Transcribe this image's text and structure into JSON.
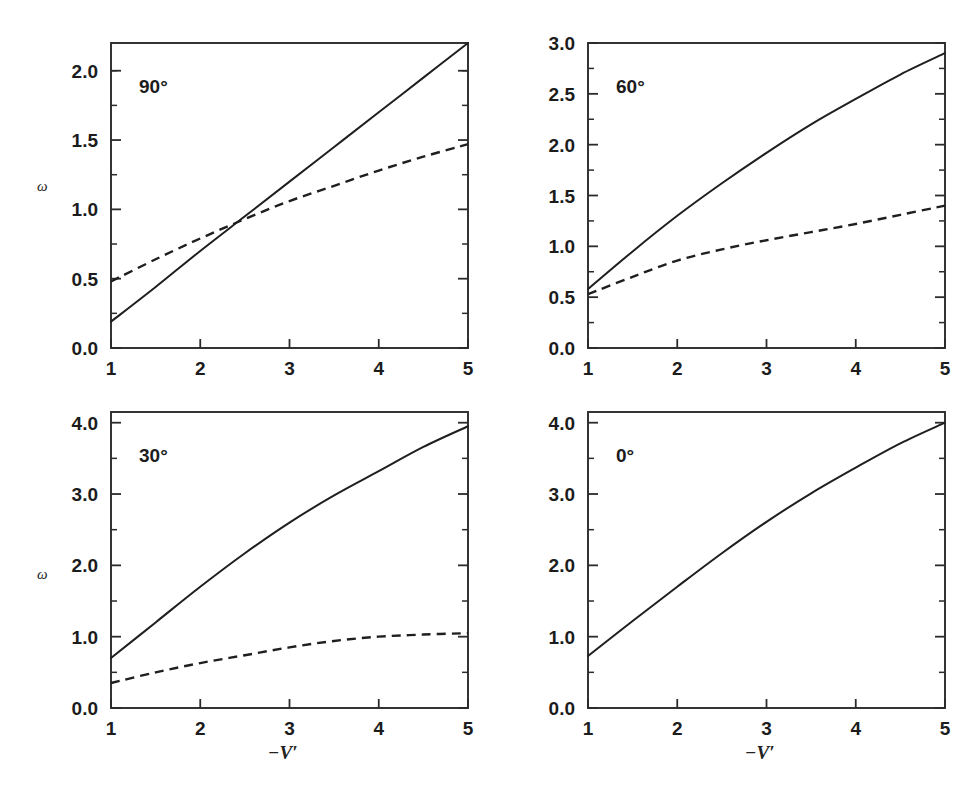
{
  "figure": {
    "background": "#ffffff",
    "ink_color": "#1f1f1f",
    "layout": "2x2 grid of line plots",
    "x_axis_label": "−V′",
    "y_axis_label": "ω"
  },
  "chart_data": [
    {
      "type": "line",
      "panel_id": "panel-90",
      "annotation": "90°",
      "title": "",
      "xlabel": "",
      "ylabel": "ω",
      "xlim": [
        1,
        5
      ],
      "ylim": [
        0.0,
        2.2
      ],
      "xticks": [
        1,
        2,
        3,
        4,
        5
      ],
      "xticklabels": [
        "1",
        "2",
        "3",
        "4",
        "5"
      ],
      "yticks": [
        0.0,
        0.5,
        1.0,
        1.5,
        2.0
      ],
      "yticklabels": [
        "0.0",
        "0.5",
        "1.0",
        "1.5",
        "2.0"
      ],
      "yminorticks": [
        0.25,
        0.75,
        1.25,
        1.75,
        2.0
      ],
      "grid": false,
      "legend": "none",
      "x": [
        1.0,
        1.5,
        2.0,
        2.5,
        3.0,
        3.5,
        4.0,
        4.5,
        5.0
      ],
      "series": [
        {
          "name": "solid",
          "style": "solid",
          "values": [
            0.19,
            0.44,
            0.7,
            0.95,
            1.2,
            1.45,
            1.7,
            1.95,
            2.2
          ]
        },
        {
          "name": "dashed",
          "style": "dashed",
          "values": [
            0.48,
            0.64,
            0.79,
            0.93,
            1.06,
            1.17,
            1.28,
            1.38,
            1.47
          ]
        }
      ],
      "notes": "solid and dashed curves cross near -V' = 2.65, omega = 1.02"
    },
    {
      "type": "line",
      "panel_id": "panel-60",
      "annotation": "60°",
      "title": "",
      "xlabel": "",
      "ylabel": "",
      "xlim": [
        1,
        5
      ],
      "ylim": [
        0.0,
        3.0
      ],
      "xticks": [
        1,
        2,
        3,
        4,
        5
      ],
      "xticklabels": [
        "1",
        "2",
        "3",
        "4",
        "5"
      ],
      "yticks": [
        0.0,
        0.5,
        1.0,
        1.5,
        2.0,
        2.5,
        3.0
      ],
      "yticklabels": [
        "0.0",
        "0.5",
        "1.0",
        "1.5",
        "2.0",
        "2.5",
        "3.0"
      ],
      "yminorticks": [
        0.25,
        0.75,
        1.25,
        1.75,
        2.25,
        2.75
      ],
      "grid": false,
      "legend": "none",
      "x": [
        1.0,
        1.5,
        2.0,
        2.5,
        3.0,
        3.5,
        4.0,
        4.5,
        5.0
      ],
      "series": [
        {
          "name": "solid",
          "style": "solid",
          "values": [
            0.58,
            0.95,
            1.3,
            1.62,
            1.92,
            2.2,
            2.45,
            2.69,
            2.9
          ]
        },
        {
          "name": "dashed",
          "style": "dashed",
          "values": [
            0.53,
            0.7,
            0.86,
            0.97,
            1.06,
            1.14,
            1.22,
            1.31,
            1.4
          ]
        }
      ],
      "notes": "both curves start together near omega = 0.55 at -V' = 1"
    },
    {
      "type": "line",
      "panel_id": "panel-30",
      "annotation": "30°",
      "title": "",
      "xlabel": "−V′",
      "ylabel": "ω",
      "xlim": [
        1,
        5
      ],
      "ylim": [
        0.0,
        4.15
      ],
      "xticks": [
        1,
        2,
        3,
        4,
        5
      ],
      "xticklabels": [
        "1",
        "2",
        "3",
        "4",
        "5"
      ],
      "yticks": [
        0.0,
        1.0,
        2.0,
        3.0,
        4.0
      ],
      "yticklabels": [
        "0.0",
        "1.0",
        "2.0",
        "3.0",
        "4.0"
      ],
      "yminorticks": [
        0.5,
        1.5,
        2.5,
        3.5
      ],
      "grid": false,
      "legend": "none",
      "x": [
        1.0,
        1.5,
        2.0,
        2.5,
        3.0,
        3.5,
        4.0,
        4.5,
        5.0
      ],
      "series": [
        {
          "name": "solid",
          "style": "solid",
          "values": [
            0.7,
            1.2,
            1.7,
            2.17,
            2.6,
            2.98,
            3.32,
            3.66,
            3.95
          ]
        },
        {
          "name": "dashed",
          "style": "dashed",
          "values": [
            0.35,
            0.5,
            0.63,
            0.74,
            0.85,
            0.94,
            1.0,
            1.03,
            1.05
          ]
        }
      ],
      "notes": "dashed curve flattens near omega = 1.05"
    },
    {
      "type": "line",
      "panel_id": "panel-0",
      "annotation": "0°",
      "title": "",
      "xlabel": "−V′",
      "ylabel": "",
      "xlim": [
        1,
        5
      ],
      "ylim": [
        0.0,
        4.15
      ],
      "xticks": [
        1,
        2,
        3,
        4,
        5
      ],
      "xticklabels": [
        "1",
        "2",
        "3",
        "4",
        "5"
      ],
      "yticks": [
        0.0,
        1.0,
        2.0,
        3.0,
        4.0
      ],
      "yticklabels": [
        "0.0",
        "1.0",
        "2.0",
        "3.0",
        "4.0"
      ],
      "yminorticks": [
        0.5,
        1.5,
        2.5,
        3.5
      ],
      "grid": false,
      "legend": "none",
      "x": [
        1.0,
        1.5,
        2.0,
        2.5,
        3.0,
        3.5,
        4.0,
        4.5,
        5.0
      ],
      "series": [
        {
          "name": "solid",
          "style": "solid",
          "values": [
            0.73,
            1.22,
            1.7,
            2.17,
            2.61,
            3.01,
            3.37,
            3.71,
            4.0
          ]
        }
      ],
      "notes": "single solid curve only, no dashed curve in this panel"
    }
  ]
}
